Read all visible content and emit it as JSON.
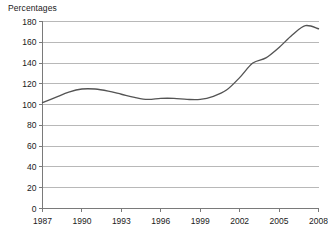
{
  "chart_title": "Percentages",
  "colors": {
    "background": "#ffffff",
    "gridline": "#b8b8b8",
    "axis": "#7a7a7a",
    "series_line": "#545454",
    "text": "#1a1a1a"
  },
  "chart_data": {
    "type": "line",
    "title": "Percentages",
    "xlabel": "",
    "ylabel": "",
    "ylim": [
      0,
      180
    ],
    "xlim": [
      1987,
      2008
    ],
    "grid": true,
    "legend": false,
    "ytick_labels": [
      "180",
      "160",
      "140",
      "120",
      "100",
      "80",
      "60",
      "40",
      "20",
      "0"
    ],
    "ytick_values": [
      180,
      160,
      140,
      120,
      100,
      80,
      60,
      40,
      20,
      0
    ],
    "xtick_labels": [
      "1987",
      "1990",
      "1993",
      "1996",
      "1999",
      "2002",
      "2005",
      "2008"
    ],
    "xtick_values": [
      1987,
      1990,
      1993,
      1996,
      1999,
      2002,
      2005,
      2008
    ],
    "x": [
      1987,
      1988,
      1989,
      1990,
      1991,
      1992,
      1993,
      1994,
      1995,
      1996,
      1997,
      1998,
      1999,
      2000,
      2001,
      2002,
      2003,
      2004,
      2005,
      2006,
      2007,
      2008
    ],
    "values": [
      102,
      107,
      112,
      115,
      115,
      113,
      110,
      107,
      105,
      106,
      106,
      105,
      105,
      108,
      114,
      126,
      140,
      145,
      155,
      167,
      176,
      173
    ],
    "series": [
      {
        "name": "Percentages",
        "values": [
          102,
          107,
          112,
          115,
          115,
          113,
          110,
          107,
          105,
          106,
          106,
          105,
          105,
          108,
          114,
          126,
          140,
          145,
          155,
          167,
          176,
          173
        ]
      }
    ]
  }
}
